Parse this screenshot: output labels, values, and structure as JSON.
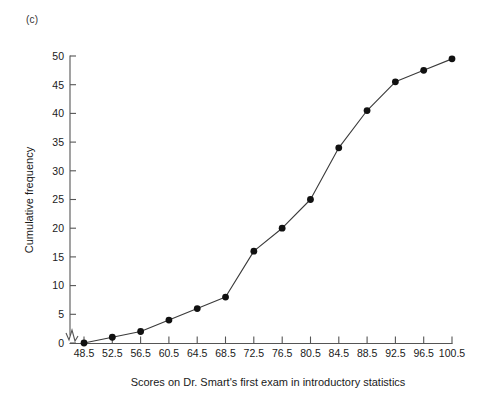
{
  "panel": {
    "label": "(c)"
  },
  "chart_data": {
    "type": "line",
    "title": "",
    "xlabel": "Scores on Dr. Smart's first exam in introductory statistics",
    "ylabel": "Cumulative frequency",
    "x": [
      48.5,
      52.5,
      56.5,
      60.5,
      64.5,
      68.5,
      72.5,
      76.5,
      80.5,
      84.5,
      88.5,
      92.5,
      96.5,
      100.5
    ],
    "values": [
      0,
      1,
      2,
      4,
      6,
      8,
      16,
      20,
      25,
      34,
      40.5,
      45.5,
      47.5,
      49.5
    ],
    "xtick_labels": [
      "48.5",
      "52.5",
      "56.5",
      "60.5",
      "64.5",
      "68.5",
      "72.5",
      "76.5",
      "80.5",
      "84.5",
      "88.5",
      "92.5",
      "96.5",
      "100.5"
    ],
    "ytick_labels": [
      "0",
      "5",
      "10",
      "15",
      "20",
      "25",
      "30",
      "35",
      "40",
      "45",
      "50"
    ],
    "yticks": [
      0,
      5,
      10,
      15,
      20,
      25,
      30,
      35,
      40,
      45,
      50
    ],
    "ylim": [
      0,
      50
    ],
    "xlim": [
      48.5,
      100.5
    ],
    "grid": false,
    "legend": "none",
    "marker": "filled-circle",
    "axis_break": "y-axis-origin-zigzag",
    "line_color": "#3a3a3a",
    "marker_color": "#111111",
    "axis_color": "#555555"
  }
}
